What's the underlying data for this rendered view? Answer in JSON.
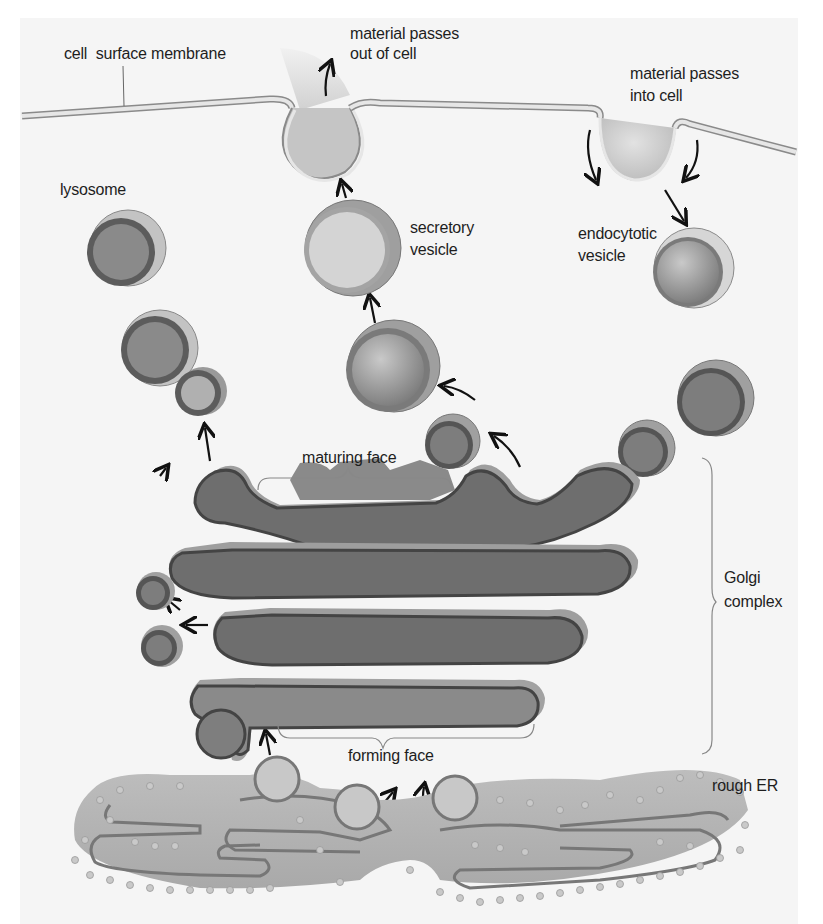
{
  "figure": {
    "labels": {
      "cell_surface_membrane": "cell  surface membrane",
      "material_out_line1": "material passes",
      "material_out_line2": "out of cell",
      "material_in_line1": "material passes",
      "material_in_line2": "into cell",
      "lysosome": "lysosome",
      "secretory_vesicle_line1": "secretory",
      "secretory_vesicle_line2": "vesicle",
      "endocytotic_vesicle_line1": "endocytotic",
      "endocytotic_vesicle_line2": "vesicle",
      "maturing_face": "maturing face",
      "golgi_complex_line1": "Golgi",
      "golgi_complex_line2": "complex",
      "forming_face": "forming face",
      "rough_er": "rough ER"
    },
    "colors": {
      "background": "#f5f5f5",
      "membrane": "#d4d4d4",
      "membrane_edge": "#8a8a8a",
      "golgi_fill": "#7d7d7d",
      "golgi_edge": "#4a4a4a",
      "golgi_shadow": "#9e9e9e",
      "vesicle_light": "#c8c8c8",
      "er_fill": "#b5b5b5",
      "ribosome": "#c9c9c9",
      "text": "#1e1e1e",
      "arrow": "#111111"
    }
  }
}
